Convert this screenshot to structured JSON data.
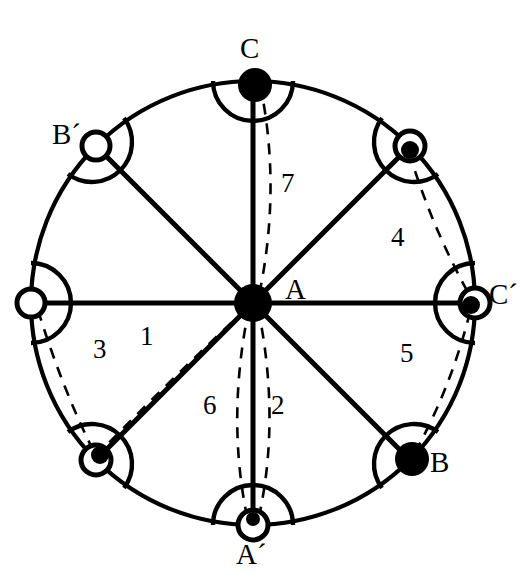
{
  "figure": {
    "background_color": "#ffffff",
    "stroke_color": "#000000",
    "circle": {
      "cx": 253,
      "cy": 303,
      "r": 222
    },
    "center_point": {
      "id": "A",
      "label": "A",
      "marker": "filled",
      "x": 253,
      "y": 303
    },
    "center_label_position": {
      "x": 285,
      "y": 275
    },
    "vertices": [
      {
        "id": "C",
        "label": "C",
        "marker": "filled",
        "angle_deg": 90,
        "x": 253,
        "y": 81,
        "label_x": 240,
        "label_y": 34,
        "arc_side": "inward"
      },
      {
        "id": "V1",
        "label": "",
        "marker": "filled",
        "angle_deg": 45,
        "x": 410,
        "y": 146,
        "label_x": 0,
        "label_y": 0,
        "arc_side": "inward"
      },
      {
        "id": "Cp",
        "label": "C´",
        "marker": "filled-ring",
        "angle_deg": 0,
        "x": 475,
        "y": 303,
        "label_x": 489,
        "label_y": 280,
        "arc_side": "inward"
      },
      {
        "id": "B",
        "label": "B",
        "marker": "filled",
        "angle_deg": -45,
        "x": 410,
        "y": 460,
        "label_x": 430,
        "label_y": 448,
        "arc_side": "inward"
      },
      {
        "id": "Ap",
        "label": "A´",
        "marker": "open",
        "angle_deg": -90,
        "x": 253,
        "y": 525,
        "label_x": 236,
        "label_y": 540,
        "arc_side": "inward"
      },
      {
        "id": "V5",
        "label": "",
        "marker": "filled-ring",
        "angle_deg": -135,
        "x": 96,
        "y": 460,
        "label_x": 0,
        "label_y": 0,
        "arc_side": "inward"
      },
      {
        "id": "B2",
        "label": "",
        "marker": "open",
        "angle_deg": 180,
        "x": 31,
        "y": 303,
        "label_x": 0,
        "label_y": 0,
        "arc_side": "inward"
      },
      {
        "id": "Bp",
        "label": "B´",
        "marker": "open",
        "angle_deg": 135,
        "x": 96,
        "y": 146,
        "label_x": 52,
        "label_y": 120,
        "arc_side": "inward"
      }
    ],
    "diameters": [
      {
        "name": "vertical-diameter",
        "from": "C",
        "to": "Ap"
      },
      {
        "name": "horizontal-diameter",
        "from": "B2",
        "to": "Cp"
      },
      {
        "name": "diagonal-diameter-ne",
        "from": "V1",
        "to": "V5"
      },
      {
        "name": "diagonal-diameter-nw",
        "from": "Bp",
        "to": "B"
      }
    ],
    "dashed_chords": [
      {
        "name": "chord-1",
        "from": "A",
        "to": "V5",
        "number": "1",
        "label_x": 140,
        "label_y": 323
      },
      {
        "name": "chord-2",
        "from": "A",
        "to": "Ap",
        "number": "2",
        "label_x": 271,
        "label_y": 392
      },
      {
        "name": "chord-3",
        "from": "B2",
        "to": "V5",
        "number": "3",
        "label_x": 93,
        "label_y": 336
      },
      {
        "name": "chord-4",
        "from": "V1",
        "to": "Cp",
        "number": "4",
        "label_x": 391,
        "label_y": 224
      },
      {
        "name": "chord-5",
        "from": "Cp",
        "to": "B",
        "number": "5",
        "label_x": 400,
        "label_y": 340
      },
      {
        "name": "chord-6",
        "from": "A",
        "to": "Ap",
        "number": "6",
        "label_x": 203,
        "label_y": 392
      },
      {
        "name": "chord-7",
        "from": "C",
        "to": "A",
        "number": "7",
        "label_x": 281,
        "label_y": 170
      }
    ],
    "numbers": [
      "1",
      "2",
      "3",
      "4",
      "5",
      "6",
      "7"
    ],
    "vertex_labels_visible": [
      "C",
      "B´",
      "C´",
      "B",
      "A´",
      "A"
    ]
  }
}
